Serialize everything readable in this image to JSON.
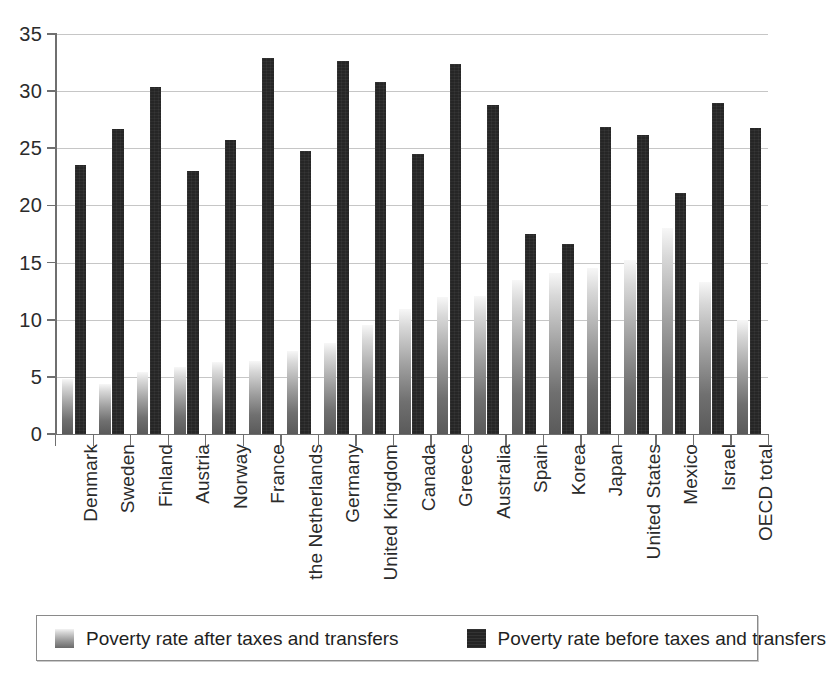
{
  "chart_data": {
    "type": "bar",
    "title": "",
    "subtitle": "",
    "xlabel": "",
    "ylabel": "",
    "ylim": [
      0,
      35
    ],
    "ytick_step": 5,
    "yticks": [
      "0",
      "5",
      "10",
      "15",
      "20",
      "25",
      "30",
      "35"
    ],
    "grid": true,
    "legend_position": "bottom",
    "categories": [
      "Denmark",
      "Sweden",
      "Finland",
      "Austria",
      "Norway",
      "France",
      "the Netherlands",
      "Germany",
      "United Kingdom",
      "Canada",
      "Greece",
      "Australia",
      "Spain",
      "Korea",
      "Japan",
      "United States",
      "Mexico",
      "Israel",
      "OECD total"
    ],
    "series": [
      {
        "name": "Poverty rate after taxes and transfers",
        "color": "#9e9e9e",
        "fill": "gradient-light",
        "values": [
          4.8,
          4.4,
          5.4,
          5.9,
          6.3,
          6.4,
          7.3,
          8.0,
          9.5,
          10.9,
          12.0,
          12.1,
          13.5,
          14.1,
          14.5,
          15.2,
          18.0,
          13.3,
          10.0
        ]
      },
      {
        "name": "Poverty rate before taxes and transfers",
        "color": "#262626",
        "fill": "solid-dark",
        "values": [
          23.5,
          26.7,
          30.4,
          23.0,
          25.7,
          32.9,
          24.8,
          32.6,
          30.8,
          24.5,
          32.4,
          28.8,
          17.5,
          16.6,
          26.9,
          26.2,
          21.1,
          29.0,
          26.8
        ]
      }
    ]
  },
  "legend": {
    "items": [
      {
        "label": "Poverty rate after taxes and transfers",
        "swatch": "gradient-light-swatch"
      },
      {
        "label": "Poverty rate before taxes and transfers",
        "swatch": "solid-dark-swatch"
      }
    ]
  }
}
